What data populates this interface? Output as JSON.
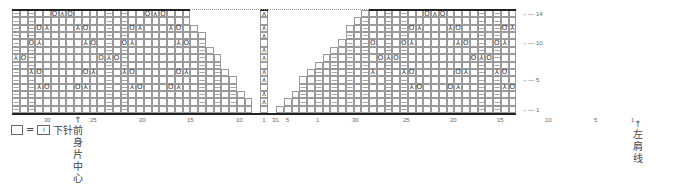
{
  "legend": {
    "empty_symbol_label": "=",
    "knit_symbol_glyph": "I",
    "meaning": "下针"
  },
  "annotations": {
    "front_center": "前身片中心",
    "left_shoulder": "左肩线"
  },
  "symbols": {
    "purl": "—",
    "yo": "O",
    "k2tog": "⅄",
    "ssk": "⅄",
    "cdd": "⋏",
    "note_yo_icon": "yarn-over-icon",
    "note_cdd_icon": "center-double-decrease-icon"
  },
  "chart_data": {
    "type": "table",
    "rows": 14,
    "row_labels": [
      "14",
      "10",
      "5",
      "1"
    ],
    "left_panel_stitch_labels": [
      "30",
      "25",
      "20",
      "15",
      "10",
      "5",
      "1"
    ],
    "center_labels": [
      "1",
      "31"
    ],
    "right_panel_stitch_labels": [
      "30",
      "25",
      "20",
      "15",
      "10",
      "5",
      "1"
    ],
    "center_column_cdd_rows": [
      14,
      12,
      11,
      9,
      8,
      6,
      5,
      3,
      2
    ],
    "legend": "□ = I 下针",
    "annotations": [
      "前身片中心",
      "左肩线"
    ]
  }
}
